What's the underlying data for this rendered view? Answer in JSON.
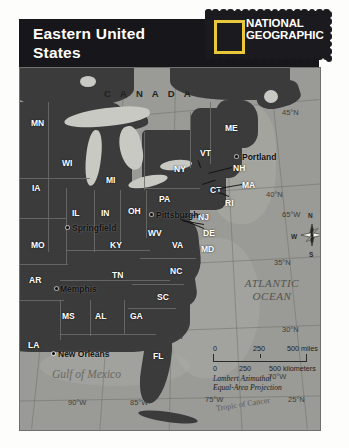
{
  "header": {
    "title_line1": "Eastern United",
    "title_line2": "States",
    "bleed_text": ""
  },
  "logo": {
    "line1": "NATIONAL",
    "line2": "GEOGRAPHIC",
    "brand_yellow": "#e9c93a",
    "stamp_black": "#1b1a1e"
  },
  "map": {
    "country_label": "C A N A D A",
    "ocean_label_line1": "ATLANTIC",
    "ocean_label_line2": "OCEAN",
    "gulf_label": "Gulf of Mexico",
    "tropic_label": "Tropic of Cancer",
    "land_color": "#3b3b3c",
    "water_color": "#9a9a96",
    "lake_color": "#c9c9c4",
    "states": [
      {
        "abbr": "MN",
        "x": 11,
        "y": 50
      },
      {
        "abbr": "WI",
        "x": 42,
        "y": 90
      },
      {
        "abbr": "MI",
        "x": 86,
        "y": 107
      },
      {
        "abbr": "IA",
        "x": 12,
        "y": 115
      },
      {
        "abbr": "IL",
        "x": 52,
        "y": 140
      },
      {
        "abbr": "IN",
        "x": 81,
        "y": 140
      },
      {
        "abbr": "OH",
        "x": 108,
        "y": 138
      },
      {
        "abbr": "MO",
        "x": 11,
        "y": 172
      },
      {
        "abbr": "KY",
        "x": 90,
        "y": 172
      },
      {
        "abbr": "WV",
        "x": 128,
        "y": 160
      },
      {
        "abbr": "VA",
        "x": 152,
        "y": 172
      },
      {
        "abbr": "PA",
        "x": 139,
        "y": 126
      },
      {
        "abbr": "NY",
        "x": 154,
        "y": 96
      },
      {
        "abbr": "VT",
        "x": 180,
        "y": 80
      },
      {
        "abbr": "ME",
        "x": 205,
        "y": 55
      },
      {
        "abbr": "NH",
        "x": 213,
        "y": 95
      },
      {
        "abbr": "MA",
        "x": 222,
        "y": 112
      },
      {
        "abbr": "CT",
        "x": 190,
        "y": 117
      },
      {
        "abbr": "RI",
        "x": 205,
        "y": 130
      },
      {
        "abbr": "NJ",
        "x": 178,
        "y": 144
      },
      {
        "abbr": "DE",
        "x": 183,
        "y": 160
      },
      {
        "abbr": "MD",
        "x": 181,
        "y": 176
      },
      {
        "abbr": "NC",
        "x": 150,
        "y": 198
      },
      {
        "abbr": "SC",
        "x": 137,
        "y": 224
      },
      {
        "abbr": "TN",
        "x": 92,
        "y": 202
      },
      {
        "abbr": "AR",
        "x": 9,
        "y": 207
      },
      {
        "abbr": "MS",
        "x": 42,
        "y": 243
      },
      {
        "abbr": "AL",
        "x": 75,
        "y": 243
      },
      {
        "abbr": "GA",
        "x": 110,
        "y": 243
      },
      {
        "abbr": "LA",
        "x": 8,
        "y": 272
      },
      {
        "abbr": "FL",
        "x": 133,
        "y": 283
      }
    ],
    "cities": [
      {
        "name": "Portland",
        "x": 222,
        "y": 84,
        "dx": 215,
        "dy": 87
      },
      {
        "name": "Pittsburgh",
        "x": 136,
        "y": 142,
        "dx": 130,
        "dy": 145
      },
      {
        "name": "Springfield",
        "x": 52,
        "y": 155,
        "dx": 46,
        "dy": 158
      },
      {
        "name": "Memphis",
        "x": 40,
        "y": 216,
        "dx": 35,
        "dy": 219
      },
      {
        "name": "New Orleans",
        "x": 38,
        "y": 281,
        "dx": 32,
        "dy": 284
      }
    ],
    "coordinates": [
      {
        "label": "45°N",
        "x": 262,
        "y": 40
      },
      {
        "label": "40°N",
        "x": 246,
        "y": 122
      },
      {
        "label": "65°W",
        "x": 262,
        "y": 142
      },
      {
        "label": "35°N",
        "x": 254,
        "y": 190
      },
      {
        "label": "30°N",
        "x": 262,
        "y": 257
      },
      {
        "label": "80°W",
        "x": 145,
        "y": 264
      },
      {
        "label": "70°W",
        "x": 248,
        "y": 304
      },
      {
        "label": "75°W",
        "x": 185,
        "y": 327
      },
      {
        "label": "25°N",
        "x": 268,
        "y": 327
      },
      {
        "label": "90°W",
        "x": 48,
        "y": 330
      },
      {
        "label": "85°W",
        "x": 110,
        "y": 330
      }
    ]
  },
  "scale": {
    "miles": {
      "start": "0",
      "mid": "250",
      "end": "500 miles"
    },
    "kilometers": {
      "start": "0",
      "mid": "250",
      "end": "500 kilometers"
    },
    "projection_line1": "Lambert Azimuthal",
    "projection_line2": "Equal-Area Projection"
  },
  "compass": {
    "n": "N",
    "e": "E",
    "s": "S",
    "w": "W"
  }
}
